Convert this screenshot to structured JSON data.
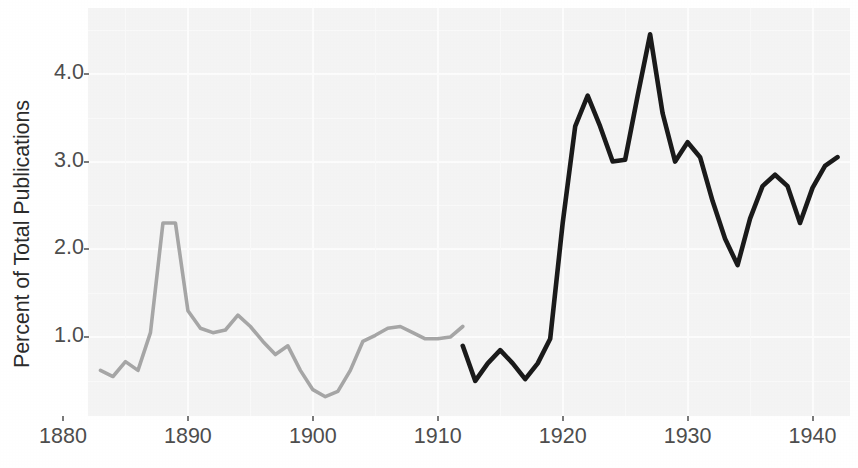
{
  "chart_data": {
    "type": "line",
    "title": "",
    "xlabel": "",
    "ylabel": "Percent of Total Publications",
    "xlim": [
      1882,
      1943
    ],
    "ylim": [
      0.1,
      4.75
    ],
    "grid": true,
    "legend": "none",
    "x_ticks": [
      1880,
      1890,
      1900,
      1910,
      1920,
      1930,
      1940
    ],
    "x_tick_labels": [
      "1880",
      "1890",
      "1900",
      "1910",
      "1920",
      "1930",
      "1940"
    ],
    "y_ticks": [
      1.0,
      2.0,
      3.0,
      4.0
    ],
    "y_tick_labels": [
      "1.0",
      "2.0",
      "3.0",
      "4.0"
    ],
    "series": [
      {
        "name": "early-period",
        "color": "#a6a6a6",
        "x": [
          1883,
          1884,
          1885,
          1886,
          1887,
          1888,
          1889,
          1890,
          1891,
          1892,
          1893,
          1894,
          1895,
          1896,
          1897,
          1898,
          1899,
          1900,
          1901,
          1902,
          1903,
          1904,
          1905,
          1906,
          1907,
          1908,
          1909,
          1910,
          1911,
          1912
        ],
        "values": [
          0.62,
          0.55,
          0.72,
          0.62,
          1.05,
          2.3,
          2.3,
          1.3,
          1.1,
          1.05,
          1.08,
          1.25,
          1.12,
          0.95,
          0.8,
          0.9,
          0.62,
          0.4,
          0.32,
          0.38,
          0.62,
          0.95,
          1.02,
          1.1,
          1.12,
          1.05,
          0.98,
          0.98,
          1.0,
          1.12
        ]
      },
      {
        "name": "later-period",
        "color": "#1a1a1a",
        "x": [
          1912,
          1913,
          1914,
          1915,
          1916,
          1917,
          1918,
          1919,
          1920,
          1921,
          1922,
          1923,
          1924,
          1925,
          1926,
          1927,
          1928,
          1929,
          1930,
          1931,
          1932,
          1933,
          1934,
          1935,
          1936,
          1937,
          1938,
          1939,
          1940,
          1941,
          1942
        ],
        "values": [
          0.9,
          0.5,
          0.7,
          0.85,
          0.7,
          0.52,
          0.7,
          0.98,
          2.3,
          3.4,
          3.75,
          3.4,
          3.0,
          3.02,
          3.75,
          4.45,
          3.55,
          3.0,
          3.22,
          3.05,
          2.55,
          2.12,
          1.82,
          2.35,
          2.72,
          2.85,
          2.72,
          2.3,
          2.7,
          2.95,
          3.05
        ]
      }
    ]
  }
}
